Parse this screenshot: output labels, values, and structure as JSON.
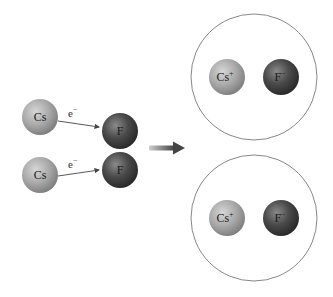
{
  "diagram": {
    "reactants": {
      "cesium_atoms": [
        {
          "label": "Cs"
        },
        {
          "label": "Cs"
        }
      ],
      "fluorine_molecule": [
        {
          "label": "F"
        },
        {
          "label": "F"
        }
      ],
      "electron_transfers": [
        {
          "label": "e",
          "charge": "−"
        },
        {
          "label": "e",
          "charge": "−"
        }
      ]
    },
    "reaction_arrow": {
      "direction": "right"
    },
    "products": [
      {
        "cation": {
          "label": "Cs",
          "charge": "+"
        },
        "anion": {
          "label": "F",
          "charge": "−"
        }
      },
      {
        "cation": {
          "label": "Cs",
          "charge": "+"
        },
        "anion": {
          "label": "F",
          "charge": "−"
        }
      }
    ],
    "colors": {
      "cesium_sphere": "#a8a8a8",
      "fluorine_sphere": "#4a4a4a",
      "circle_outline": "#888888",
      "arrow": "#555555"
    }
  }
}
